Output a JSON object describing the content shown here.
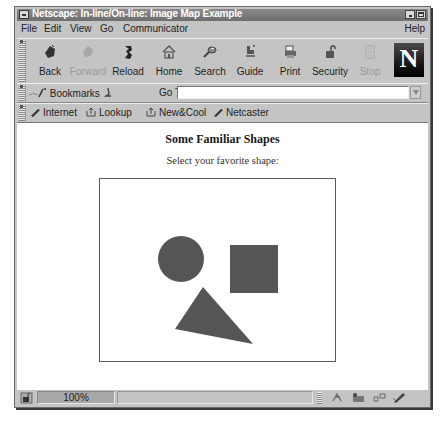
{
  "window": {
    "title": "Netscape: In-line/On-line: Image Map Example"
  },
  "menubar": {
    "items": [
      {
        "label": "File"
      },
      {
        "label": "Edit"
      },
      {
        "label": "View"
      },
      {
        "label": "Go"
      },
      {
        "label": "Communicator"
      },
      {
        "label": "Help"
      }
    ]
  },
  "toolbar": {
    "buttons": [
      {
        "label": "Back",
        "icon": "back-arrow-icon",
        "enabled": true
      },
      {
        "label": "Forward",
        "icon": "forward-arrow-icon",
        "enabled": false
      },
      {
        "label": "Reload",
        "icon": "reload-icon",
        "enabled": true
      },
      {
        "label": "Home",
        "icon": "home-icon",
        "enabled": true
      },
      {
        "label": "Search",
        "icon": "search-icon",
        "enabled": true
      },
      {
        "label": "Guide",
        "icon": "guide-icon",
        "enabled": true
      },
      {
        "label": "Print",
        "icon": "print-icon",
        "enabled": true
      },
      {
        "label": "Security",
        "icon": "lock-icon",
        "enabled": true
      },
      {
        "label": "Stop",
        "icon": "stop-icon",
        "enabled": false
      }
    ],
    "logo_letter": "N"
  },
  "location_bar": {
    "bookmarks_label": "Bookmarks",
    "goto_label": "Go To:",
    "url_value": ""
  },
  "personal_toolbar": {
    "items": [
      {
        "label": "Internet"
      },
      {
        "label": "Lookup"
      },
      {
        "label": "New&Cool"
      },
      {
        "label": "Netcaster"
      }
    ]
  },
  "page": {
    "heading": "Some Familiar Shapes",
    "subheading": "Select your favorite shape:",
    "image_map": {
      "shapes": [
        {
          "name": "circle",
          "color": "#555555"
        },
        {
          "name": "square",
          "color": "#555555"
        },
        {
          "name": "triangle",
          "color": "#555555"
        }
      ]
    }
  },
  "statusbar": {
    "progress": "100%",
    "message": ""
  }
}
